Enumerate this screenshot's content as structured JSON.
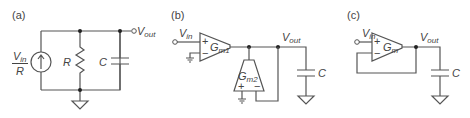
{
  "panels": {
    "a": {
      "label": "(a)",
      "source_num": "V",
      "source_num_sub": "in",
      "source_den": "R",
      "resistor": "R",
      "capacitor": "C",
      "output": "V",
      "output_sub": "out"
    },
    "b": {
      "label": "(b)",
      "input": "V",
      "input_sub": "in",
      "amp1": "G",
      "amp1_sub": "m1",
      "amp2": "G",
      "amp2_sub": "m2",
      "plus": "+",
      "minus": "−",
      "output": "V",
      "output_sub": "out",
      "capacitor": "C"
    },
    "c": {
      "label": "(c)",
      "input": "V",
      "input_sub": "in",
      "amp": "G",
      "amp_sub": "m",
      "plus": "+",
      "minus": "−",
      "output": "V",
      "output_sub": "out",
      "capacitor": "C"
    }
  }
}
